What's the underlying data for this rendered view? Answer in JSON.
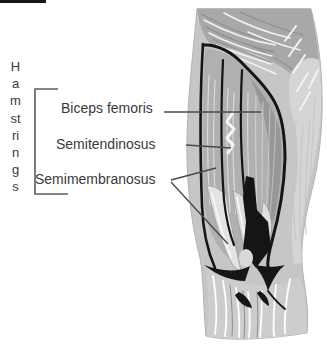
{
  "labels": {
    "group": "Hamstrings",
    "muscles": [
      {
        "name": "Biceps femoris"
      },
      {
        "name": "Semitendinosus"
      },
      {
        "name": "Semimembranosus"
      }
    ]
  },
  "colors": {
    "background": "#ffffff",
    "label_text": "#3a3a3a",
    "leader_line": "#4a4a4a",
    "bracket_line": "#5c5c5c",
    "ink_outline": "#151515",
    "muscle_base": "#c6c6c6",
    "muscle_mid": "#b0b0b0",
    "muscle_shadow": "#979797",
    "muscle_light_band": "#d5d5d5",
    "muscle_highlight": "#f6f6f6"
  }
}
